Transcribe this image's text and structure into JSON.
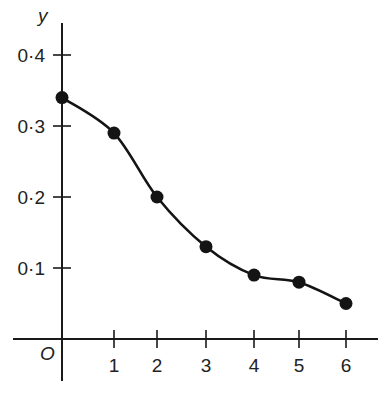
{
  "chart_data": {
    "type": "line",
    "title": "",
    "xlabel": "",
    "ylabel": "y",
    "origin_label": "O",
    "x": [
      0,
      1,
      2,
      3,
      4,
      5,
      6
    ],
    "series": [
      {
        "name": "y",
        "values": [
          0.34,
          0.29,
          0.2,
          0.13,
          0.09,
          0.08,
          0.05
        ]
      }
    ],
    "x_ticks": [
      1,
      2,
      3,
      4,
      5,
      6
    ],
    "x_tick_labels": [
      "1",
      "2",
      "3",
      "4",
      "5",
      "6"
    ],
    "y_ticks": [
      0.1,
      0.2,
      0.3,
      0.4
    ],
    "y_tick_labels": [
      "0·1",
      "0·2",
      "0·3",
      "0·4"
    ],
    "xlim": [
      -1,
      6.7
    ],
    "ylim": [
      -0.06,
      0.45
    ],
    "grid": false,
    "legend": false,
    "markers": "filled-circle",
    "smooth": true
  },
  "colors": {
    "ink": "#141414",
    "background": "#ffffff"
  }
}
